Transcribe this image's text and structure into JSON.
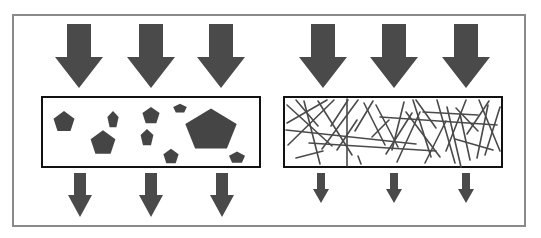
{
  "diagram": {
    "type": "filtration-comparison",
    "colors": {
      "arrow": "#4a4a4a",
      "shape": "#454545",
      "fiber": "#4a4a4a",
      "box_border": "#111111",
      "frame": "#8a8a8a",
      "background": "#ffffff"
    },
    "panels": [
      {
        "id": "particle-filter",
        "box": {
          "x": 42,
          "y": 97,
          "w": 218,
          "h": 70
        },
        "inflow_arrows": [
          {
            "cx": 79,
            "top": 24,
            "shaft_w": 24,
            "head_w": 48,
            "head_start": 57,
            "tip": 88
          },
          {
            "cx": 151,
            "top": 24,
            "shaft_w": 24,
            "head_w": 48,
            "head_start": 57,
            "tip": 88
          },
          {
            "cx": 221,
            "top": 24,
            "shaft_w": 24,
            "head_w": 48,
            "head_start": 57,
            "tip": 88
          }
        ],
        "outflow_arrows": [
          {
            "cx": 80,
            "top": 173,
            "shaft_w": 12,
            "head_w": 24,
            "head_start": 195,
            "tip": 217
          },
          {
            "cx": 151,
            "top": 173,
            "shaft_w": 12,
            "head_w": 24,
            "head_start": 195,
            "tip": 217
          },
          {
            "cx": 222,
            "top": 173,
            "shaft_w": 12,
            "head_w": 24,
            "head_start": 195,
            "tip": 217
          }
        ],
        "pentagons": [
          {
            "cx": 64,
            "cy": 121,
            "r": 11,
            "sx": 1,
            "sy": 1
          },
          {
            "cx": 113,
            "cy": 119,
            "r": 9,
            "sx": 0.65,
            "sy": 1
          },
          {
            "cx": 103,
            "cy": 142,
            "r": 13,
            "sx": 1,
            "sy": 1
          },
          {
            "cx": 151,
            "cy": 115,
            "r": 9,
            "sx": 1,
            "sy": 1
          },
          {
            "cx": 147,
            "cy": 137,
            "r": 9,
            "sx": 0.75,
            "sy": 1
          },
          {
            "cx": 180,
            "cy": 108,
            "r": 6,
            "sx": 1.2,
            "sy": 0.8
          },
          {
            "cx": 171,
            "cy": 156,
            "r": 8,
            "sx": 1,
            "sy": 1
          },
          {
            "cx": 211,
            "cy": 128,
            "r": 27,
            "sx": 1,
            "sy": 0.82
          },
          {
            "cx": 237,
            "cy": 157,
            "r": 7,
            "sx": 1.2,
            "sy": 0.9
          }
        ]
      },
      {
        "id": "fiber-filter",
        "box": {
          "x": 284,
          "y": 97,
          "w": 218,
          "h": 70
        },
        "inflow_arrows": [
          {
            "cx": 323,
            "top": 24,
            "shaft_w": 24,
            "head_w": 48,
            "head_start": 57,
            "tip": 88
          },
          {
            "cx": 394,
            "top": 24,
            "shaft_w": 24,
            "head_w": 48,
            "head_start": 57,
            "tip": 88
          },
          {
            "cx": 466,
            "top": 24,
            "shaft_w": 24,
            "head_w": 48,
            "head_start": 57,
            "tip": 88
          }
        ],
        "outflow_arrows": [
          {
            "cx": 321,
            "top": 173,
            "shaft_w": 8,
            "head_w": 16,
            "head_start": 189,
            "tip": 203
          },
          {
            "cx": 394,
            "top": 173,
            "shaft_w": 8,
            "head_w": 16,
            "head_start": 189,
            "tip": 203
          },
          {
            "cx": 466,
            "top": 173,
            "shaft_w": 8,
            "head_w": 16,
            "head_start": 189,
            "tip": 203
          }
        ],
        "fibers": [
          [
            287,
            105,
            332,
            146
          ],
          [
            296,
            100,
            318,
            126
          ],
          [
            287,
            123,
            327,
            100
          ],
          [
            288,
            145,
            334,
            100
          ],
          [
            304,
            101,
            320,
            164
          ],
          [
            318,
            101,
            352,
            155
          ],
          [
            322,
            149,
            358,
            100
          ],
          [
            331,
            126,
            348,
            100
          ],
          [
            347,
            99,
            347,
            166
          ],
          [
            337,
            150,
            357,
            120
          ],
          [
            355,
            131,
            373,
            101
          ],
          [
            361,
            164,
            358,
            156
          ],
          [
            364,
            103,
            385,
            145
          ],
          [
            376,
            105,
            398,
            147
          ],
          [
            372,
            137,
            389,
            120
          ],
          [
            392,
            150,
            404,
            102
          ],
          [
            386,
            154,
            412,
            113
          ],
          [
            397,
            162,
            420,
            112
          ],
          [
            406,
            112,
            440,
            157
          ],
          [
            416,
            100,
            436,
            128
          ],
          [
            413,
            100,
            431,
            157
          ],
          [
            425,
            163,
            446,
            121
          ],
          [
            437,
            100,
            455,
            163
          ],
          [
            446,
            151,
            466,
            100
          ],
          [
            447,
            107,
            461,
            167
          ],
          [
            456,
            108,
            478,
            131
          ],
          [
            467,
            134,
            489,
            101
          ],
          [
            479,
            100,
            500,
            151
          ],
          [
            477,
            158,
            488,
            105
          ],
          [
            485,
            155,
            500,
            107
          ],
          [
            460,
            114,
            470,
            160
          ],
          [
            286,
            130,
            416,
            144
          ],
          [
            309,
            143,
            436,
            151
          ],
          [
            380,
            117,
            497,
            125
          ],
          [
            423,
            112,
            478,
            115
          ],
          [
            455,
            139,
            493,
            150
          ],
          [
            296,
            158,
            323,
            151
          ]
        ]
      }
    ],
    "frame": {
      "x": 13,
      "y": 15,
      "w": 512,
      "h": 211
    }
  }
}
